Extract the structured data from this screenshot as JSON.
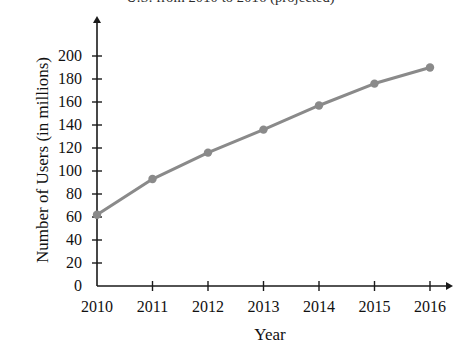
{
  "chart_data": {
    "type": "line",
    "title": "U.S. from 2010 to 2016 (projected)",
    "xlabel": "Year",
    "ylabel": "Number of Users (in millions)",
    "categories": [
      "2010",
      "2011",
      "2012",
      "2013",
      "2014",
      "2015",
      "2016"
    ],
    "values": [
      62,
      93,
      116,
      136,
      157,
      176,
      190
    ],
    "series": [
      {
        "name": "Number of Users (in millions)",
        "values": [
          62,
          93,
          116,
          136,
          157,
          176,
          190
        ]
      }
    ],
    "x": [
      2010,
      2011,
      2012,
      2013,
      2014,
      2015,
      2016
    ],
    "xlim": [
      2010,
      2016
    ],
    "ylim": [
      0,
      200
    ],
    "yticks": [
      0,
      20,
      40,
      60,
      80,
      100,
      120,
      140,
      160,
      180,
      200
    ],
    "ytick_labels": [
      "0",
      "20",
      "40",
      "60",
      "80",
      "100",
      "120",
      "140",
      "160",
      "180",
      "200"
    ],
    "xticks": [
      2010,
      2011,
      2012,
      2013,
      2014,
      2015,
      2016
    ],
    "xtick_labels": [
      "2010",
      "2011",
      "2012",
      "2013",
      "2014",
      "2015",
      "2016"
    ],
    "grid": false,
    "legend": false,
    "legend_position": "none",
    "marker": "circle",
    "line_color": "#8a8a8a",
    "marker_color": "#8a8a8a",
    "axis_color": "#1a1a1a",
    "background_color": "#ffffff",
    "axis_arrows": true,
    "annotations": []
  }
}
